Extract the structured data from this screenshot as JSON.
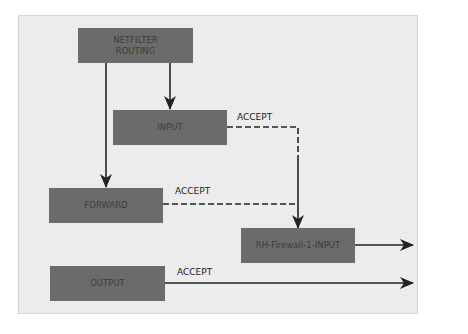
{
  "diagram": {
    "nodes": [
      {
        "id": "netfilter-routing",
        "label": "NETFILTER\nROUTING",
        "line1": "NETFILTER",
        "line2": "ROUTING"
      },
      {
        "id": "input",
        "label": "INPUT"
      },
      {
        "id": "forward",
        "label": "FORWARD"
      },
      {
        "id": "rh-firewall-1-input",
        "label": "RH-Firewall-1-INPUT"
      },
      {
        "id": "output",
        "label": "OUTPUT"
      }
    ],
    "edges": [
      {
        "from": "netfilter-routing",
        "to": "input",
        "style": "solid",
        "label": ""
      },
      {
        "from": "netfilter-routing",
        "to": "forward",
        "style": "solid",
        "label": ""
      },
      {
        "from": "input",
        "to": "rh-firewall-1-input",
        "style": "dashed",
        "label": "ACCEPT"
      },
      {
        "from": "forward",
        "to": "rh-firewall-1-input",
        "style": "dashed",
        "label": "ACCEPT"
      },
      {
        "from": "rh-firewall-1-input",
        "to": "exit",
        "style": "solid",
        "label": ""
      },
      {
        "from": "output",
        "to": "exit",
        "style": "solid",
        "label": "ACCEPT"
      }
    ],
    "edge_labels": {
      "input_accept": "ACCEPT",
      "forward_accept": "ACCEPT",
      "output_accept": "ACCEPT"
    },
    "colors": {
      "background": "#ececec",
      "box_fill": "#6b6b6b",
      "box_text": "#3c3c3c",
      "line": "#222222"
    }
  }
}
